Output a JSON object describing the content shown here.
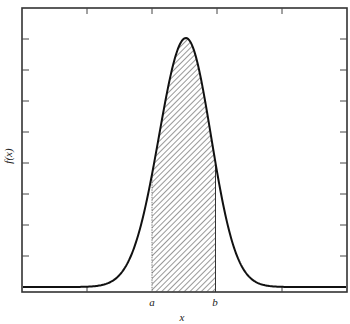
{
  "chart_data": {
    "type": "area",
    "title": "",
    "xlabel": "x",
    "ylabel": "f(x)",
    "grid": false,
    "legend": null,
    "x_tick_count": 6,
    "y_tick_count": 9,
    "x_tick_labels": [],
    "y_tick_labels": [],
    "annotations": [
      {
        "label": "a",
        "x_fraction": 0.4
      },
      {
        "label": "b",
        "x_fraction": 0.595
      }
    ],
    "curve": {
      "shape": "normal-like density",
      "peak_x_fraction": 0.505,
      "peak_height_fraction": 0.96,
      "baseline_offset": "curve approaches a small constant just above the x-axis"
    },
    "shaded_region": {
      "from": "a",
      "to": "b",
      "pattern": "diagonal hatch"
    },
    "series": [
      {
        "name": "f(x)",
        "x": [
          0,
          0.1,
          0.2,
          0.3,
          0.35,
          0.4,
          0.45,
          0.5,
          0.505,
          0.55,
          0.6,
          0.65,
          0.7,
          0.8,
          0.9,
          1.0
        ],
        "y": [
          0.0,
          0.0,
          0.0,
          0.05,
          0.22,
          0.46,
          0.8,
          0.99,
          1.0,
          0.86,
          0.49,
          0.19,
          0.05,
          0.0,
          0.0,
          0.0
        ]
      }
    ]
  },
  "labels": {
    "x_axis": "x",
    "y_axis": "f(x)",
    "a": "a",
    "b": "b"
  },
  "colors": {
    "line": "#111111",
    "frame": "#333333",
    "hatch": "#444444",
    "background": "#ffffff"
  }
}
